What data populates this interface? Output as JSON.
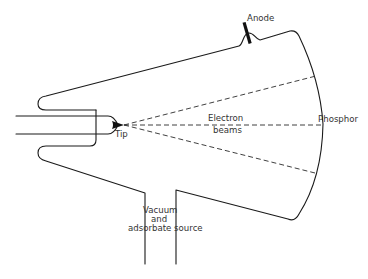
{
  "diagram": {
    "labels": {
      "anode": "Anode",
      "phosphor": "Phosphor",
      "tip": "Tip",
      "beams_line1": "Electron",
      "beams_line2": "beams",
      "source_line1": "Vacuum",
      "source_line2": "and",
      "source_line3": "adsorbate source"
    },
    "components": [
      "envelope",
      "anode",
      "phosphor-screen",
      "tip",
      "electron-beams",
      "vacuum-port"
    ],
    "colors": {
      "stroke": "#1a1a1a",
      "text": "#333333",
      "background": "#ffffff"
    }
  }
}
